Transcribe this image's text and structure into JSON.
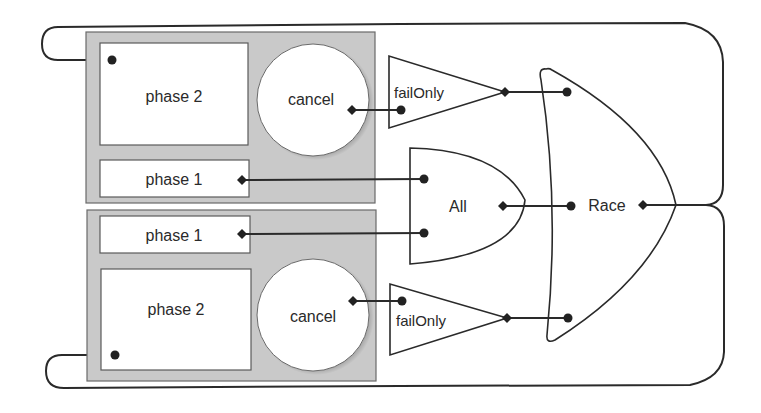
{
  "diagram": {
    "groups": [
      {
        "id": "top",
        "phase2": {
          "label": "phase 2"
        },
        "phase1": {
          "label": "phase 1"
        },
        "cancel": {
          "label": "cancel"
        },
        "failOnly": {
          "label": "failOnly"
        }
      },
      {
        "id": "bottom",
        "phase1": {
          "label": "phase 1"
        },
        "phase2": {
          "label": "phase 2"
        },
        "cancel": {
          "label": "cancel"
        },
        "failOnly": {
          "label": "failOnly"
        }
      }
    ],
    "all_gate": {
      "label": "All"
    },
    "race_gate": {
      "label": "Race"
    },
    "colors": {
      "line": "#2a2a2a",
      "group_fill": "#c9c9c9",
      "box_fill": "#ffffff"
    }
  }
}
